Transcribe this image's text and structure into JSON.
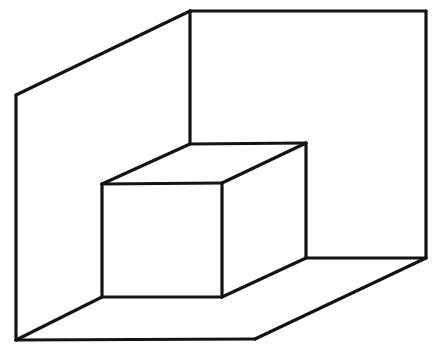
{
  "figure": {
    "type": "line-drawing",
    "canvas": {
      "width": 438,
      "height": 353,
      "background": "#ffffff"
    },
    "stroke": {
      "color": "#141414",
      "width": 3.2,
      "width_thin": 2.6
    },
    "parts": [
      {
        "name": "left-wall",
        "label": "Left wall",
        "fill": "#ffffff",
        "points": "16,95 190,11 190,144 102,184 102,297 16,340"
      },
      {
        "name": "back-wall",
        "label": "Back wall",
        "fill": "#ffffff",
        "points": "190,11 426,11 426,258 306,258 306,143 190,144"
      },
      {
        "name": "floor",
        "label": "Floor",
        "fill": "#ffffff",
        "points": "16,340 255,339 426,258 306,258 222,297 102,297"
      },
      {
        "name": "box-front-face",
        "label": "Box front face",
        "fill": "#ffffff",
        "points": "102,184 222,183 222,297 102,297"
      },
      {
        "name": "box-top-face",
        "label": "Box top face",
        "fill": "#ffffff",
        "points": "102,184 190,144 306,143 222,183"
      },
      {
        "name": "box-right-face",
        "label": "Box right face",
        "fill": "#ffffff",
        "points": "222,183 306,143 306,258 222,297"
      }
    ],
    "edges": [
      {
        "name": "room-top-ridge-left",
        "label": "Left wall top edge",
        "d": "M 16,95 L 190,11"
      },
      {
        "name": "room-top-back",
        "label": "Back wall top edge",
        "d": "M 190,11 L 426,11"
      },
      {
        "name": "room-right-vertical",
        "label": "Back wall right vertical edge",
        "d": "M 426,11 L 426,258"
      },
      {
        "name": "room-corner-vertical",
        "label": "Room inner corner vertical edge",
        "d": "M 190,11 L 190,144"
      },
      {
        "name": "room-left-vertical",
        "label": "Left wall front vertical edge",
        "d": "M 16,95 L 16,340"
      },
      {
        "name": "floor-front-left",
        "label": "Floor front left edge",
        "d": "M 16,340 L 255,339"
      },
      {
        "name": "floor-front-right",
        "label": "Floor front right edge",
        "d": "M 255,339 L 426,258"
      },
      {
        "name": "floor-back-right",
        "label": "Floor right baseboard edge",
        "d": "M 426,258 L 306,258"
      },
      {
        "name": "floor-left-diagonal",
        "label": "Floor left baseboard diagonal",
        "d": "M 16,340 L 102,297"
      },
      {
        "name": "box-top-left-diagonal",
        "label": "Box top left diagonal",
        "d": "M 102,184 L 190,144"
      },
      {
        "name": "box-top-back",
        "label": "Box top back edge",
        "d": "M 190,144 L 306,143"
      },
      {
        "name": "box-top-right-diagonal",
        "label": "Box top right diagonal",
        "d": "M 222,183 L 306,143"
      },
      {
        "name": "box-top-front",
        "label": "Box top front edge",
        "d": "M 102,184 L 222,183"
      },
      {
        "name": "box-front-left-vertical",
        "label": "Box front left vertical edge",
        "d": "M 102,184 L 102,297"
      },
      {
        "name": "box-front-right-vertical",
        "label": "Box front right vertical edge",
        "d": "M 222,183 L 222,297"
      },
      {
        "name": "box-back-right-vertical",
        "label": "Box back right vertical edge",
        "d": "M 306,143 L 306,258"
      },
      {
        "name": "box-bottom-front",
        "label": "Box bottom front edge",
        "d": "M 102,297 L 222,297"
      },
      {
        "name": "box-bottom-right-diag",
        "label": "Box bottom right diagonal",
        "d": "M 222,297 L 306,258"
      }
    ]
  }
}
